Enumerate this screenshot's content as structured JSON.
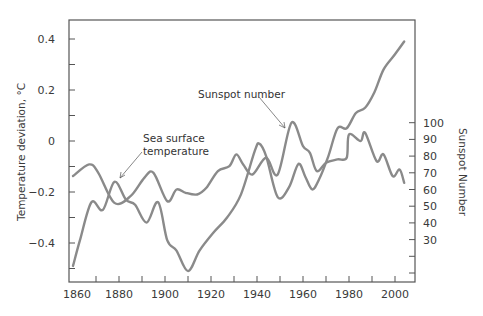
{
  "chart_data": {
    "type": "line",
    "title": "",
    "xlabel": "",
    "ylabel": "Temperature deviation, °C",
    "ylabel_right": "Sunspot Number",
    "xlim": [
      1860,
      2010
    ],
    "ylim": [
      -0.55,
      0.47
    ],
    "ylim_right_ticks": [
      30,
      40,
      50,
      60,
      70,
      80,
      90,
      100
    ],
    "x_ticks": [
      1860,
      1880,
      1900,
      1920,
      1940,
      1960,
      1980,
      2000
    ],
    "x_ticks_labels": [
      "1860",
      "1880",
      "1900",
      "1920",
      "1940",
      "1960",
      "1980",
      "2000"
    ],
    "y_ticks": [
      -0.4,
      -0.2,
      0,
      0.2,
      0.4
    ],
    "y_ticks_labels": [
      "-0.4",
      "-0.2",
      "0",
      "0.2",
      "0.4"
    ],
    "y_right_ticks_labels": [
      "30",
      "40",
      "50",
      "60",
      "70",
      "80",
      "90",
      "100"
    ],
    "grid": false,
    "legend": "none (inline annotations)",
    "annotations": [
      {
        "text": [
          "Sea surface",
          "temperature"
        ],
        "points_to": {
          "x": 1878,
          "y": -0.16
        }
      },
      {
        "text": [
          "Sunspot number"
        ],
        "points_to": {
          "x": 1955,
          "y": 0.03
        }
      }
    ],
    "series": [
      {
        "name": "Sea surface temperature",
        "axis": "left",
        "color": "#8a8a8a",
        "x": [
          1860,
          1863,
          1868,
          1873,
          1878,
          1883,
          1887,
          1892,
          1897,
          1901,
          1905,
          1910,
          1915,
          1921,
          1927,
          1933,
          1939,
          1941,
          1944,
          1949,
          1954,
          1958,
          1961,
          1964,
          1967,
          1971,
          1975,
          1979,
          1983,
          1987,
          1991,
          1995,
          2000,
          2004
        ],
        "values": [
          -0.49,
          -0.39,
          -0.24,
          -0.27,
          -0.16,
          -0.23,
          -0.25,
          -0.32,
          -0.24,
          -0.39,
          -0.43,
          -0.51,
          -0.43,
          -0.36,
          -0.3,
          -0.21,
          -0.04,
          -0.01,
          -0.06,
          -0.22,
          -0.18,
          -0.09,
          -0.14,
          -0.19,
          -0.15,
          -0.06,
          0.05,
          0.05,
          0.11,
          0.13,
          0.19,
          0.28,
          0.34,
          0.39
        ]
      },
      {
        "name": "Sunspot number",
        "axis": "right",
        "color": "#8a8a8a",
        "x": [
          1860,
          1867,
          1871,
          1878,
          1885,
          1891,
          1895,
          1901,
          1905,
          1909,
          1914,
          1918,
          1923,
          1928,
          1931,
          1934,
          1938,
          1944,
          1949,
          1955,
          1960,
          1963,
          1966,
          1970,
          1975,
          1979,
          1980,
          1985,
          1987,
          1992,
          1995,
          1999,
          2002,
          2004
        ],
        "values": [
          68,
          75,
          70,
          52,
          56,
          67,
          70,
          53,
          60,
          58,
          57,
          61,
          71,
          74,
          81,
          75,
          69,
          79,
          69,
          100,
          86,
          82,
          71,
          76,
          78,
          79,
          93,
          89,
          94,
          77,
          81,
          68,
          72,
          64
        ]
      }
    ]
  },
  "axes": {
    "left_title": "Temperature deviation, °C",
    "right_title": "Sunspot Number"
  },
  "annotations": {
    "sst_line1": "Sea surface",
    "sst_line2": "temperature",
    "sunspot": "Sunspot number"
  }
}
